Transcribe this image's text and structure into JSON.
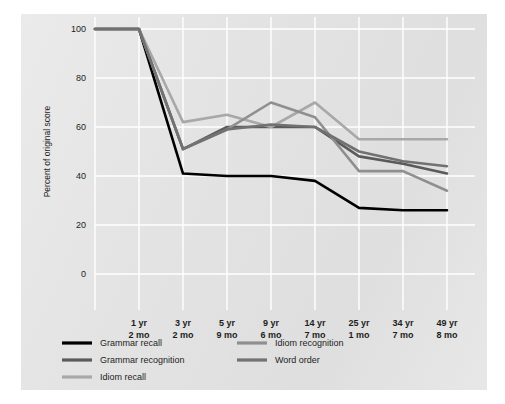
{
  "chart_data": {
    "type": "line",
    "title": "",
    "xlabel": "",
    "ylabel": "Percent of original score",
    "ylim": [
      0,
      100
    ],
    "yticks": [
      0,
      20,
      40,
      60,
      80,
      100
    ],
    "grid": true,
    "legend_position": "bottom",
    "x": [
      "",
      "1 yr\n2 mo",
      "3 yr\n2 mo",
      "5 yr\n9 mo",
      "9 yr\n6 mo",
      "14 yr\n7 mo",
      "25 yr\n1 mo",
      "34 yr\n7 mo",
      "49 yr\n8 mo"
    ],
    "categories": [
      "1 yr 2 mo",
      "3 yr 2 mo",
      "5 yr 9 mo",
      "9 yr 6 mo",
      "14 yr 7 mo",
      "25 yr 1 mo",
      "34 yr 7 mo",
      "49 yr 8 mo"
    ],
    "xtick_labels": [
      {
        "year": "1 yr",
        "month": "2 mo"
      },
      {
        "year": "3 yr",
        "month": "2 mo"
      },
      {
        "year": "5 yr",
        "month": "9 mo"
      },
      {
        "year": "9 yr",
        "month": "6 mo"
      },
      {
        "year": "14 yr",
        "month": "7 mo"
      },
      {
        "year": "25 yr",
        "month": "1 mo"
      },
      {
        "year": "34 yr",
        "month": "7 mo"
      },
      {
        "year": "49 yr",
        "month": "8 mo"
      }
    ],
    "ytick_labels": [
      "0",
      "20",
      "40",
      "60",
      "80",
      "100"
    ],
    "series": [
      {
        "name": "Grammar recall",
        "color": "#000000",
        "values": [
          100,
          41,
          40,
          40,
          38,
          27,
          26,
          26
        ],
        "origin_value": 100
      },
      {
        "name": "Grammar recognition",
        "color": "#5a5a5a",
        "values": [
          100,
          51,
          60,
          60,
          60,
          48,
          45,
          41
        ],
        "origin_value": 100
      },
      {
        "name": "Idiom recall",
        "color": "#a8a8a8",
        "values": [
          100,
          62,
          65,
          60,
          70,
          55,
          55,
          55
        ],
        "origin_value": 100
      },
      {
        "name": "Idiom recognition",
        "color": "#8f8f8f",
        "values": [
          100,
          51,
          59,
          70,
          64,
          42,
          42,
          34
        ],
        "origin_value": 100
      },
      {
        "name": "Word order",
        "color": "#717171",
        "values": [
          100,
          51,
          59,
          61,
          60,
          50,
          46,
          44
        ],
        "origin_value": 100
      }
    ]
  },
  "legend": {
    "column_left": [
      {
        "label": "Grammar recall",
        "color": "#000000"
      },
      {
        "label": "Grammar recognition",
        "color": "#5a5a5a"
      },
      {
        "label": "Idiom recall",
        "color": "#a8a8a8"
      }
    ],
    "column_right": [
      {
        "label": "Idiom recognition",
        "color": "#8f8f8f"
      },
      {
        "label": "Word order",
        "color": "#717171"
      }
    ]
  },
  "colors": {
    "panel_background": "#e3e3e3",
    "page_background": "#ffffff",
    "gridline": "#ffffff",
    "text": "#1d1d1d"
  }
}
